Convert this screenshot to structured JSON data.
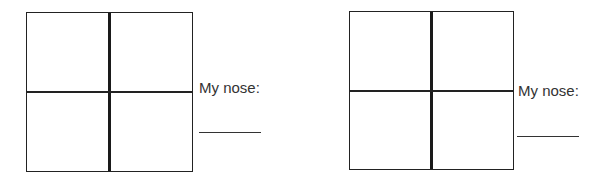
{
  "worksheet": {
    "panels": [
      {
        "label": "My nose:",
        "answer": ""
      },
      {
        "label": "My nose:",
        "answer": ""
      }
    ]
  }
}
